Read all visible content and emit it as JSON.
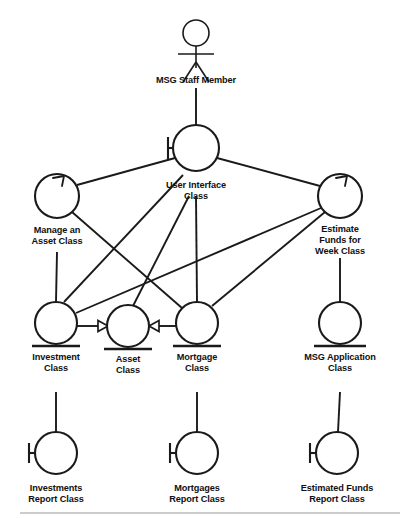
{
  "diagram": {
    "stereotype_legend": {
      "boundary": "circle-with-left-bar",
      "control": "circle-with-arrow-on-rim",
      "entity": "circle-with-underline"
    },
    "actor": {
      "name": "actor-msg-staff-member",
      "label": "MSG Staff Member",
      "x": 196,
      "y": 40
    },
    "nodes": [
      {
        "id": "user_interface",
        "label_lines": [
          "User Interface",
          "Class"
        ],
        "stereotype": "boundary",
        "cx": 196,
        "cy": 148,
        "r": 23
      },
      {
        "id": "manage_asset",
        "label_lines": [
          "Manage an",
          "Asset Class"
        ],
        "stereotype": "control",
        "cx": 57,
        "cy": 196,
        "r": 22
      },
      {
        "id": "estimate_funds",
        "label_lines": [
          "Estimate",
          "Funds for",
          "Week Class"
        ],
        "stereotype": "control",
        "cx": 340,
        "cy": 196,
        "r": 22
      },
      {
        "id": "investment",
        "label_lines": [
          "Investment",
          "Class"
        ],
        "stereotype": "entity",
        "cx": 56,
        "cy": 323,
        "r": 21
      },
      {
        "id": "asset",
        "label_lines": [
          "Asset",
          "Class"
        ],
        "stereotype": "entity",
        "cx": 128,
        "cy": 326,
        "r": 21
      },
      {
        "id": "mortgage",
        "label_lines": [
          "Mortgage",
          "Class"
        ],
        "stereotype": "entity",
        "cx": 197,
        "cy": 323,
        "r": 21
      },
      {
        "id": "msg_application",
        "label_lines": [
          "MSG Application",
          "Class"
        ],
        "stereotype": "entity",
        "cx": 340,
        "cy": 323,
        "r": 21
      },
      {
        "id": "investments_report",
        "label_lines": [
          "Investments",
          "Report Class"
        ],
        "stereotype": "boundary",
        "cx": 56,
        "cy": 453,
        "r": 21
      },
      {
        "id": "mortgages_report",
        "label_lines": [
          "Mortgages",
          "Report Class"
        ],
        "stereotype": "boundary",
        "cx": 197,
        "cy": 453,
        "r": 21
      },
      {
        "id": "estimated_funds_report",
        "label_lines": [
          "Estimated Funds",
          "Report Class"
        ],
        "stereotype": "boundary",
        "cx": 337,
        "cy": 453,
        "r": 21
      }
    ],
    "associations": [
      {
        "from": "actor",
        "to": "user_interface",
        "kind": "association"
      },
      {
        "from": "user_interface",
        "to": "manage_asset",
        "kind": "association"
      },
      {
        "from": "user_interface",
        "to": "estimate_funds",
        "kind": "association"
      },
      {
        "from": "user_interface",
        "to": "investment",
        "kind": "association"
      },
      {
        "from": "user_interface",
        "to": "mortgage",
        "kind": "association"
      },
      {
        "from": "user_interface",
        "to": "asset",
        "kind": "association"
      },
      {
        "from": "manage_asset",
        "to": "investment",
        "kind": "association"
      },
      {
        "from": "manage_asset",
        "to": "mortgage",
        "kind": "association"
      },
      {
        "from": "estimate_funds",
        "to": "investment",
        "kind": "association"
      },
      {
        "from": "estimate_funds",
        "to": "mortgage",
        "kind": "association"
      },
      {
        "from": "estimate_funds",
        "to": "msg_application",
        "kind": "association"
      },
      {
        "from": "investment",
        "to": "investments_report",
        "kind": "association"
      },
      {
        "from": "mortgage",
        "to": "mortgages_report",
        "kind": "association"
      },
      {
        "from": "msg_application",
        "to": "estimated_funds_report",
        "kind": "association"
      },
      {
        "from": "investment",
        "to": "asset",
        "kind": "generalization"
      },
      {
        "from": "mortgage",
        "to": "asset",
        "kind": "generalization"
      }
    ],
    "colors": {
      "stroke": "#1a1a1a",
      "background": "#ffffff",
      "text": "#111111",
      "rule": "#9a9a9a"
    }
  }
}
